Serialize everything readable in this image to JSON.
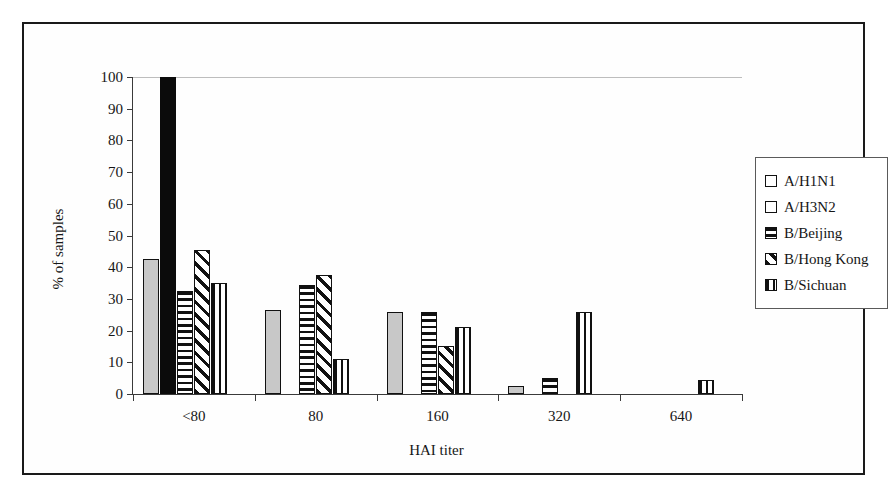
{
  "figure": {
    "background_color": "#ffffff",
    "frame_color": "#1a1a1a"
  },
  "chart_data": {
    "type": "bar",
    "title": "",
    "subtitle": "",
    "xlabel": "HAI titer",
    "ylabel": "% of samples",
    "categories": [
      "<80",
      "80",
      "160",
      "320",
      "640"
    ],
    "ylim": [
      0,
      100
    ],
    "yticks": [
      0,
      10,
      20,
      30,
      40,
      50,
      60,
      70,
      80,
      90,
      100
    ],
    "ytick_labels": [
      "0",
      "10",
      "20",
      "30",
      "40",
      "50",
      "60",
      "70",
      "80",
      "90",
      "100"
    ],
    "grid": false,
    "legend_position": "right",
    "series": [
      {
        "name": "A/H1N1",
        "pattern": "solid-gray",
        "color": "#c8c8c8",
        "values": [
          42.5,
          26.5,
          26,
          2.5,
          0
        ]
      },
      {
        "name": "A/H3N2",
        "pattern": "solid-black",
        "color": "#0b0b0b",
        "values": [
          100,
          0,
          0,
          0,
          0
        ]
      },
      {
        "name": "B/Beijing",
        "pattern": "horizontal",
        "color": "#111111",
        "values": [
          32.5,
          34.5,
          26,
          5,
          0
        ]
      },
      {
        "name": "B/Hong Kong",
        "pattern": "diagonal",
        "color": "#111111",
        "values": [
          45.5,
          37.5,
          15,
          0,
          0
        ]
      },
      {
        "name": "B/Sichuan",
        "pattern": "vertical",
        "color": "#111111",
        "values": [
          35,
          11,
          21,
          26,
          4.5
        ]
      }
    ]
  }
}
